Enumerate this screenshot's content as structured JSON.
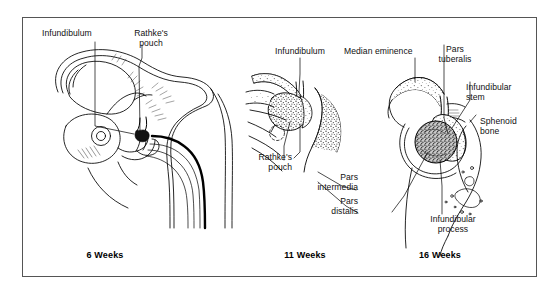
{
  "figure": {
    "background": "#ffffff",
    "frame_color": "#555555",
    "ink_color": "#000000"
  },
  "panels": [
    {
      "id": "panel-6-weeks",
      "caption": "6 Weeks",
      "labels": [
        {
          "name": "infundibulum",
          "text": "Infundibulum"
        },
        {
          "name": "rathkes-pouch",
          "text": "Rathke's\npouch"
        }
      ]
    },
    {
      "id": "panel-11-weeks",
      "caption": "11 Weeks",
      "labels": [
        {
          "name": "infundibulum",
          "text": "Infundibulum"
        },
        {
          "name": "rathkes-pouch",
          "text": "Rathke's\npouch"
        },
        {
          "name": "pars-intermedia",
          "text": "Pars\nintermedia"
        },
        {
          "name": "pars-distalis",
          "text": "Pars\ndistalis"
        }
      ]
    },
    {
      "id": "panel-16-weeks",
      "caption": "16 Weeks",
      "labels": [
        {
          "name": "median-eminence",
          "text": "Median eminence"
        },
        {
          "name": "pars-tuberalis",
          "text": "Pars\ntuberalis"
        },
        {
          "name": "infundibular-stem",
          "text": "Infundibular\nstem"
        },
        {
          "name": "sphenoid-bone",
          "text": "Sphenoid\nbone"
        },
        {
          "name": "infundibular-process",
          "text": "Infundibular\nprocess"
        }
      ]
    }
  ],
  "text": {
    "p1_infundibulum": "Infundibulum",
    "p1_rathkes_pouch": "Rathke's\npouch",
    "p1_caption": "6 Weeks",
    "p2_infundibulum": "Infundibulum",
    "p2_rathkes_pouch": "Rathke's\npouch",
    "p2_pars_intermedia": "Pars\nintermedia",
    "p2_pars_distalis": "Pars\ndistalis",
    "p2_caption": "11 Weeks",
    "p3_median_eminence": "Median eminence",
    "p3_pars_tuberalis": "Pars\ntuberalis",
    "p3_infundibular_stem": "Infundibular\nstem",
    "p3_sphenoid_bone": "Sphenoid\nbone",
    "p3_infundibular_process": "Infundibular\nprocess",
    "p3_caption": "16 Weeks"
  }
}
